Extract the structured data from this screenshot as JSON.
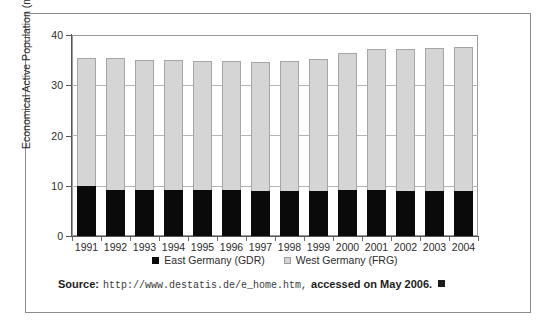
{
  "chart_data": {
    "type": "bar",
    "subtype": "stacked-vertical",
    "title": "",
    "xlabel": "",
    "ylabel": "Economical Active Population (millions)",
    "ylim": [
      0,
      40
    ],
    "yticks": [
      0,
      10,
      20,
      30,
      40
    ],
    "ytick_labels": [
      "0",
      "10",
      "20",
      "30",
      "40"
    ],
    "grid": "horizontal",
    "legend_position": "bottom-center",
    "categories": [
      "1991",
      "1992",
      "1993",
      "1994",
      "1995",
      "1996",
      "1997",
      "1998",
      "1999",
      "2000",
      "2001",
      "2002",
      "2003",
      "2004"
    ],
    "series": [
      {
        "name": "East Germany (GDR)",
        "color": "#0a0a0a",
        "values": [
          10.0,
          9.2,
          9.1,
          9.1,
          9.1,
          9.1,
          9.0,
          9.0,
          9.0,
          9.1,
          9.1,
          9.0,
          8.9,
          8.9
        ]
      },
      {
        "name": "West Germany (FRG)",
        "color": "#d5d5d5",
        "values": [
          25.5,
          26.3,
          26.0,
          26.0,
          25.7,
          25.7,
          25.6,
          25.8,
          26.3,
          27.4,
          28.1,
          28.2,
          28.5,
          28.7
        ]
      }
    ],
    "totals": [
      35.5,
      35.5,
      35.1,
      35.1,
      34.8,
      34.8,
      34.6,
      34.8,
      35.3,
      36.5,
      37.2,
      37.2,
      37.4,
      37.6
    ]
  },
  "axes": {
    "y_title": "Economical Active Population (millions)",
    "y_tick_labels": [
      "40",
      "30",
      "20",
      "10",
      "0"
    ],
    "x_tick_labels": [
      "1991",
      "1992",
      "1993",
      "1994",
      "1995",
      "1996",
      "1997",
      "1998",
      "1999",
      "2000",
      "2001",
      "2002",
      "2003",
      "2004"
    ]
  },
  "legend": {
    "items": [
      {
        "label": "East Germany (GDR)",
        "swatch": "filled-black-square"
      },
      {
        "label": "West Germany (FRG)",
        "swatch": "outlined-gray-square"
      }
    ]
  },
  "source": {
    "prefix": "Source:",
    "url": "http://www.destatis.de/e_home.htm,",
    "suffix": "accessed on May 2006.",
    "end_marker": "filled-square"
  },
  "colors": {
    "east_germany": "#0a0a0a",
    "west_germany": "#d5d5d5",
    "bar_outline": "#a6a6a6",
    "gridline": "#b4b4b4",
    "axis": "#555555",
    "frame": "#8b8b8b",
    "background": "#ffffff"
  }
}
